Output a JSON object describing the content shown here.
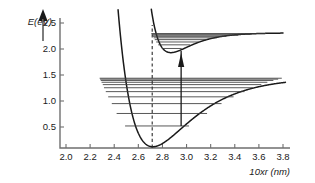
{
  "chart_data": {
    "type": "line",
    "title": "",
    "subtitle": "",
    "xlabel": "10xr (nm)",
    "ylabel": "E(eV)",
    "xlim": [
      1.93,
      3.87
    ],
    "ylim": [
      0.0,
      2.72
    ],
    "grid": false,
    "legend": "none",
    "x_ticks": [
      "2.0",
      "2.2",
      "2.4",
      "2.6",
      "2.8",
      "3.0",
      "3.2",
      "3.4",
      "3.6",
      "3.8"
    ],
    "x_tick_values": [
      2.0,
      2.2,
      2.4,
      2.6,
      2.8,
      3.0,
      3.2,
      3.4,
      3.6,
      3.8
    ],
    "y_ticks": [
      "0.5",
      "1.0",
      "1.5",
      "2.0",
      "2.5"
    ],
    "y_tick_values": [
      0.5,
      1.0,
      1.5,
      2.0,
      2.5
    ],
    "series": [
      {
        "name": "ground-state-morse-potential",
        "type": "morse",
        "r_min": 2.72,
        "e_min": 0.12,
        "e_dissociation": 1.45,
        "beta": 3.05,
        "r_start": 2.14,
        "r_end": 3.82,
        "vibrational_levels": [
          {
            "v": 0,
            "energy": 0.52,
            "r_left": 2.49,
            "r_right": 3.02
          },
          {
            "v": 1,
            "energy": 0.76,
            "r_left": 2.42,
            "r_right": 3.17
          },
          {
            "v": 2,
            "energy": 0.95,
            "r_left": 2.38,
            "r_right": 3.29
          },
          {
            "v": 3,
            "energy": 1.08,
            "r_left": 2.35,
            "r_right": 3.39
          },
          {
            "v": 4,
            "energy": 1.18,
            "r_left": 2.33,
            "r_right": 3.48
          },
          {
            "v": 5,
            "energy": 1.255,
            "r_left": 2.315,
            "r_right": 3.55
          },
          {
            "v": 6,
            "energy": 1.315,
            "r_left": 2.305,
            "r_right": 3.62
          },
          {
            "v": 7,
            "energy": 1.36,
            "r_left": 2.295,
            "r_right": 3.67
          },
          {
            "v": 8,
            "energy": 1.395,
            "r_left": 2.288,
            "r_right": 3.72
          },
          {
            "v": 9,
            "energy": 1.42,
            "r_left": 2.283,
            "r_right": 3.76
          },
          {
            "v": 10,
            "energy": 1.438,
            "r_left": 2.279,
            "r_right": 3.79
          }
        ]
      },
      {
        "name": "excited-state-morse-potential",
        "type": "morse",
        "r_min": 2.87,
        "e_min": 1.93,
        "e_dissociation": 2.31,
        "beta": 5.6,
        "r_start": 2.57,
        "r_end": 3.8,
        "vibrational_levels": [
          {
            "v": 0,
            "energy": 2.01,
            "r_left": 2.795,
            "r_right": 2.96
          },
          {
            "v": 1,
            "energy": 2.08,
            "r_left": 2.765,
            "r_right": 3.03
          },
          {
            "v": 2,
            "energy": 2.135,
            "r_left": 2.748,
            "r_right": 3.1
          },
          {
            "v": 3,
            "energy": 2.18,
            "r_left": 2.736,
            "r_right": 3.17
          },
          {
            "v": 4,
            "energy": 2.215,
            "r_left": 2.727,
            "r_right": 3.25
          },
          {
            "v": 5,
            "energy": 2.243,
            "r_left": 2.72,
            "r_right": 3.33
          },
          {
            "v": 6,
            "energy": 2.265,
            "r_left": 2.715,
            "r_right": 3.43
          },
          {
            "v": 7,
            "energy": 2.283,
            "r_left": 2.711,
            "r_right": 3.54
          },
          {
            "v": 8,
            "energy": 2.297,
            "r_left": 2.708,
            "r_right": 3.66
          }
        ]
      }
    ],
    "annotations": [
      {
        "name": "franck-condon-line",
        "type": "vertical-dashed-line",
        "x": 2.715,
        "y_bottom": 0.1,
        "y_top": 2.46
      },
      {
        "name": "vertical-transition-arrow",
        "type": "arrow",
        "x": 2.955,
        "y_start": 0.52,
        "y_end": 1.96,
        "direction": "up"
      }
    ],
    "colors": {
      "curve": "#1a1a1a",
      "level": "#3a3a3a",
      "axis": "#6f6f6f",
      "background": "#ffffff"
    }
  },
  "axes": {
    "y_axis_title": "E(eV)",
    "x_axis_title": "10xr (nm)",
    "y_tick_labels": [
      "2.5",
      "2.0",
      "1.5",
      "1.0",
      "0.5"
    ],
    "x_tick_labels": [
      "2.0",
      "2.2",
      "2.4",
      "2.6",
      "2.8",
      "3.0",
      "3.2",
      "3.4",
      "3.6",
      "3.8"
    ]
  }
}
